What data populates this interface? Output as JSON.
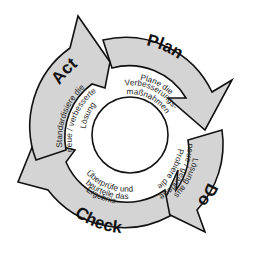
{
  "diagram": {
    "type": "PDCA cycle",
    "colors": {
      "band_fill": "#d4d4d4",
      "stroke": "#111111",
      "inner_fill": "#ffffff",
      "background": "#ffffff"
    },
    "phases": [
      {
        "label": "Plan",
        "text_lines": [
          "Plane die",
          "Verbesserungs-",
          "maßnahmen"
        ]
      },
      {
        "label": "Do",
        "text_lines": [
          "Probiere die",
          "neue / geänderte",
          "Lösung aus"
        ]
      },
      {
        "label": "Check",
        "text_lines": [
          "Überprüfe und",
          "beurteile das",
          "Ergebnis"
        ]
      },
      {
        "label": "Act",
        "text_lines": [
          "Standardisiere die",
          "neue / verbesserte",
          "Lösung"
        ]
      }
    ]
  }
}
